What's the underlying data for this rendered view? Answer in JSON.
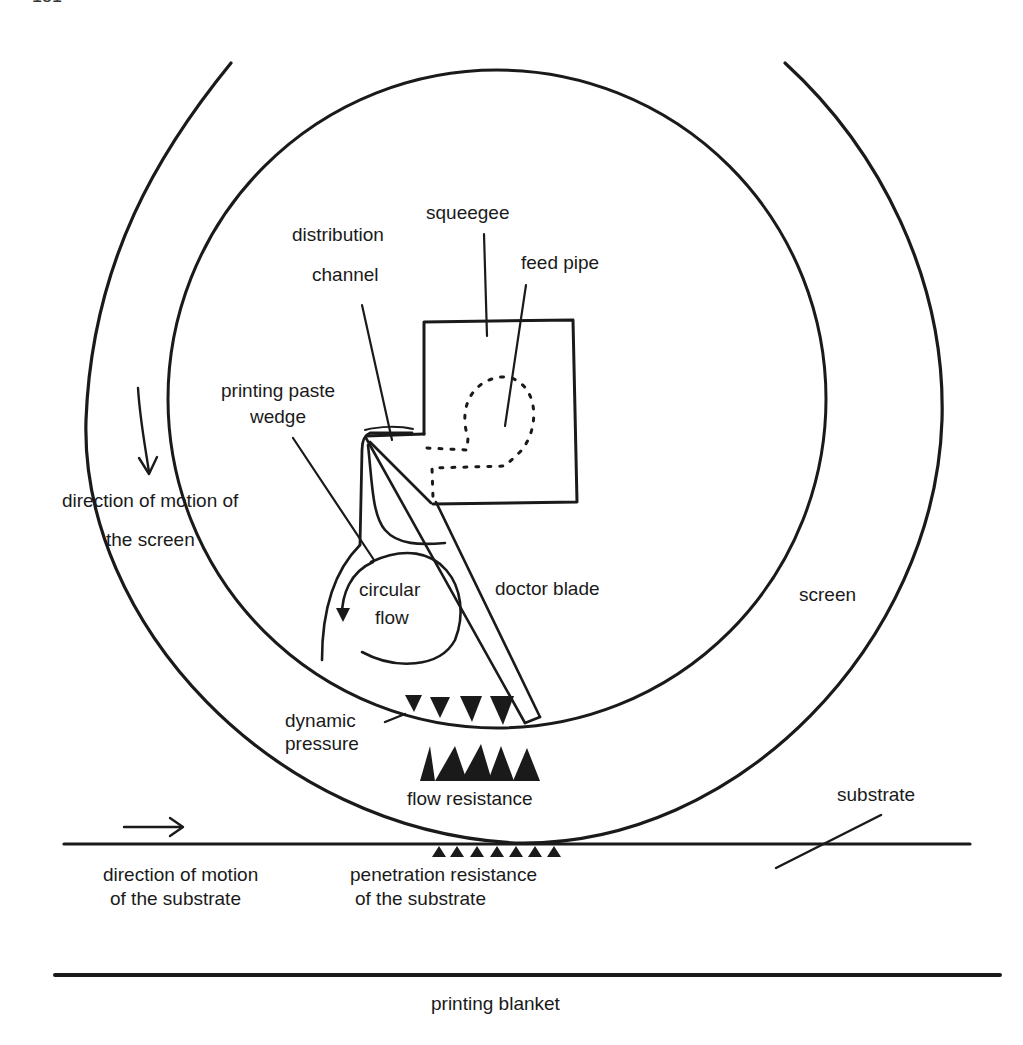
{
  "page": {
    "number_fragment": "151"
  },
  "diagram": {
    "colors": {
      "stroke": "#1a1a1a",
      "background": "#ffffff"
    },
    "labels": {
      "squeegee": "squeegee",
      "distribution_channel_1": "distribution",
      "distribution_channel_2": "channel",
      "feed_pipe": "feed pipe",
      "printing_paste_wedge_1": "printing paste",
      "printing_paste_wedge_2": "wedge",
      "direction_screen_1": "direction of motion of",
      "direction_screen_2": "the screen",
      "circular_flow_1": "circular",
      "circular_flow_2": "flow",
      "doctor_blade": "doctor blade",
      "screen": "screen",
      "dynamic_pressure_1": "dynamic",
      "dynamic_pressure_2": "pressure",
      "flow_resistance": "flow resistance",
      "substrate": "substrate",
      "direction_substrate_1": "direction of motion",
      "direction_substrate_2": "of the substrate",
      "penetration_resistance_1": "penetration resistance",
      "penetration_resistance_2": "of the substrate",
      "printing_blanket": "printing blanket"
    },
    "markers": {
      "dynamic_pressure_count": 4,
      "flow_resistance_count": 5,
      "penetration_resistance_count": 7
    }
  }
}
